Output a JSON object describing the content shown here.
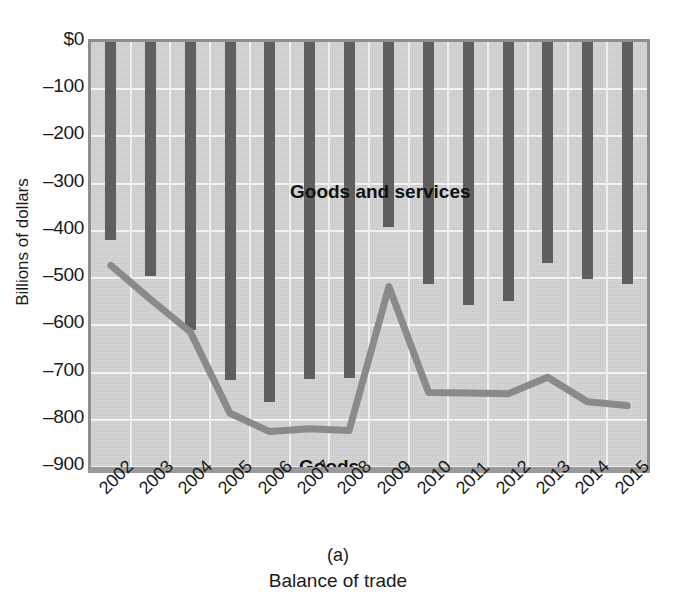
{
  "figure": {
    "panel_letter": "(a)",
    "caption": "Balance of trade",
    "cropped_header_text": ""
  },
  "axes": {
    "y_title": "Billions of dollars",
    "y_ticks": [
      "$0",
      "–100",
      "–200",
      "–300",
      "–400",
      "–500",
      "–600",
      "–700",
      "–800",
      "–900"
    ],
    "x_ticks": [
      "2002",
      "2003",
      "2004",
      "2005",
      "2006",
      "2007",
      "2008",
      "2009",
      "2010",
      "2011",
      "2012",
      "2013",
      "2014",
      "2015"
    ]
  },
  "series_labels": {
    "bars": "Goods and services",
    "line": "Goods"
  },
  "colors": {
    "bar": "#5f5f5f",
    "line": "#8a8a8a",
    "plot_background": "#d4d4d4",
    "grid": "#f2f2f2",
    "frame": "#8e8e8e",
    "text": "#1a1a1a"
  },
  "chart_data": {
    "type": "bar",
    "title": "Balance of trade",
    "xlabel": "",
    "ylabel": "Billions of dollars",
    "ylim": [
      -900,
      0
    ],
    "grid": true,
    "legend": "inline-labels",
    "categories": [
      "2002",
      "2003",
      "2004",
      "2005",
      "2006",
      "2007",
      "2008",
      "2009",
      "2010",
      "2011",
      "2012",
      "2013",
      "2014",
      "2015"
    ],
    "series": [
      {
        "name": "Goods and services",
        "type": "bar",
        "values": [
          -420,
          -495,
          -610,
          -715,
          -762,
          -714,
          -712,
          -392,
          -512,
          -557,
          -549,
          -469,
          -501,
          -512
        ]
      },
      {
        "name": "Goods",
        "type": "line",
        "values": [
          -473,
          -545,
          -614,
          -786,
          -825,
          -819,
          -823,
          -518,
          -742,
          -743,
          -745,
          -710,
          -762,
          -770
        ]
      }
    ]
  }
}
